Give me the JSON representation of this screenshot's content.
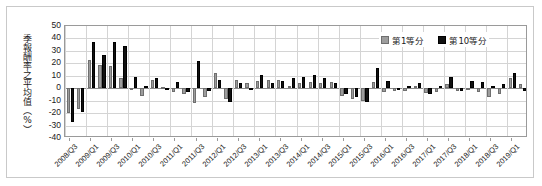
{
  "chart_data": {
    "type": "bar",
    "title": "",
    "subtitle": "",
    "xlabel": "",
    "ylabel": "季報酬率之平均值（%）",
    "ylim": [
      -40,
      50
    ],
    "ytick_step": 10,
    "yticks": [
      50,
      40,
      30,
      20,
      10,
      0,
      -10,
      -20,
      -30,
      -40
    ],
    "grid": true,
    "legend_position": "top-right",
    "legend": [
      "第1等分",
      "第10等分"
    ],
    "colors": {
      "series_1": "#9d9d9d",
      "series_10": "#111111",
      "gridline": "#d4d4d4",
      "axis": "#9a9a9a",
      "text": "#1a1a1a"
    },
    "x_tick_labels": [
      "2008/Q3",
      "2009/Q1",
      "2009/Q3",
      "2010/Q1",
      "2010/Q3",
      "2011/Q1",
      "2011/Q3",
      "2012/Q1",
      "2012/Q3",
      "2013/Q1",
      "2013/Q3",
      "2014/Q1",
      "2014/Q3",
      "2015/Q1",
      "2015/Q3",
      "2016/Q1",
      "2016/Q3",
      "2017/Q1",
      "2017/Q3",
      "2018/Q1",
      "2018/Q3",
      "2019/Q1"
    ],
    "x_tick_label_interval": 2,
    "categories": [
      "2008/Q3",
      "2008/Q4",
      "2009/Q1",
      "2009/Q2",
      "2009/Q3",
      "2009/Q4",
      "2010/Q1",
      "2010/Q2",
      "2010/Q3",
      "2010/Q4",
      "2011/Q1",
      "2011/Q2",
      "2011/Q3",
      "2011/Q4",
      "2012/Q1",
      "2012/Q2",
      "2012/Q3",
      "2012/Q4",
      "2013/Q1",
      "2013/Q2",
      "2013/Q3",
      "2013/Q4",
      "2014/Q1",
      "2014/Q2",
      "2014/Q3",
      "2014/Q4",
      "2015/Q1",
      "2015/Q2",
      "2015/Q3",
      "2015/Q4",
      "2016/Q1",
      "2016/Q2",
      "2016/Q3",
      "2016/Q4",
      "2017/Q1",
      "2017/Q2",
      "2017/Q3",
      "2017/Q4",
      "2018/Q1",
      "2018/Q2",
      "2018/Q3",
      "2018/Q4",
      "2019/Q1",
      "2019/Q2"
    ],
    "series": [
      {
        "name": "第1等分",
        "color": "#9d9d9d",
        "values": [
          -20,
          -17,
          23,
          19,
          18,
          8,
          -1,
          -6,
          7,
          1,
          -3,
          -5,
          -12,
          -7,
          12,
          -9,
          7,
          4,
          6,
          7,
          7,
          2,
          4,
          5,
          4,
          5,
          -6,
          -9,
          -10,
          5,
          -3,
          -2,
          -2,
          2,
          -4,
          -3,
          3,
          -2,
          -1,
          -3,
          -7,
          -5,
          8,
          3
        ]
      },
      {
        "name": "第10等分",
        "color": "#111111",
        "values": [
          -27,
          -19,
          37,
          27,
          37,
          34,
          9,
          2,
          8,
          -1,
          5,
          -3,
          22,
          -2,
          7,
          -11,
          4,
          -1,
          11,
          4,
          6,
          8,
          9,
          11,
          8,
          4,
          -5,
          -7,
          -11,
          16,
          6,
          -1,
          2,
          4,
          -5,
          2,
          9,
          -2,
          6,
          5,
          2,
          3,
          12,
          -2
        ]
      }
    ]
  }
}
